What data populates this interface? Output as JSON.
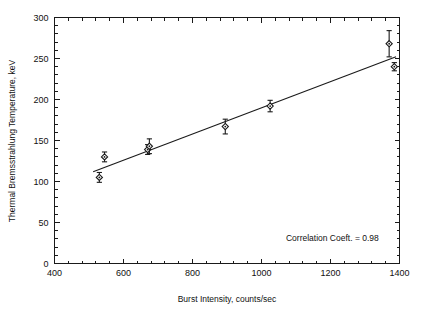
{
  "figure": {
    "background_color": "#ffffff",
    "foreground_color": "#1a1a1a"
  },
  "chart_data": {
    "type": "scatter",
    "title": "",
    "xlabel": "Burst Intensity, counts/sec",
    "ylabel": "Thermal Bremsstrahlung Temperature, keV",
    "xlim": [
      400,
      1400
    ],
    "ylim": [
      0,
      300
    ],
    "xticks": [
      400,
      600,
      800,
      1000,
      1200,
      1400
    ],
    "yticks": [
      0,
      50,
      100,
      150,
      200,
      250,
      300
    ],
    "xtick_labels": [
      "400",
      "600",
      "800",
      "1000",
      "1200",
      "1400"
    ],
    "ytick_labels": [
      "0",
      "50",
      "100",
      "150",
      "200",
      "250",
      "300"
    ],
    "x_minor_tick_interval": 40,
    "y_minor_tick_interval": 10,
    "grid": false,
    "legend": null,
    "marker_style": "open-diamond-with-dot",
    "points": [
      {
        "x": 530,
        "y": 105,
        "yerr": 6
      },
      {
        "x": 545,
        "y": 130,
        "yerr": 6
      },
      {
        "x": 670,
        "y": 139,
        "yerr": 6
      },
      {
        "x": 675,
        "y": 143,
        "yerr": 9
      },
      {
        "x": 895,
        "y": 167,
        "yerr": 9
      },
      {
        "x": 1025,
        "y": 192,
        "yerr": 7
      },
      {
        "x": 1370,
        "y": 268,
        "yerr": 16
      },
      {
        "x": 1385,
        "y": 240,
        "yerr": 5
      }
    ],
    "fit_line": {
      "x_start": 512,
      "y_start": 112,
      "x_end": 1390,
      "y_end": 252
    },
    "annotations": [
      {
        "text": "Correlation Coeft. = 0.98",
        "x": 1340,
        "y": 28,
        "anchor": "end"
      }
    ],
    "correlation_coefficient": 0.98
  }
}
